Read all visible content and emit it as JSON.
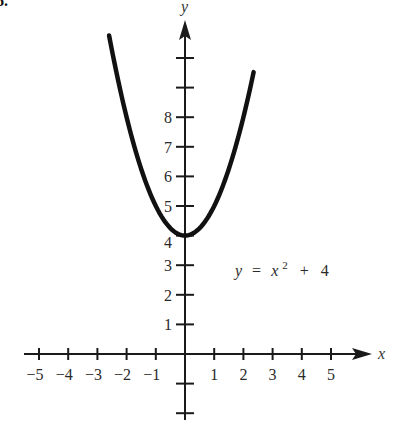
{
  "problem_number": "6.",
  "chart_data": {
    "type": "line",
    "title": "",
    "equation_label": "y = x² + 4",
    "equation_parts": {
      "lhs": "y",
      "eq": "=",
      "var": "x",
      "exp": "2",
      "plus": "+",
      "const": "4"
    },
    "xlabel": "x",
    "ylabel": "y",
    "x_ticks": [
      -5,
      -4,
      -3,
      -2,
      -1,
      1,
      2,
      3,
      4,
      5
    ],
    "x_tick_labels": [
      "−5",
      "−4",
      "−3",
      "−2",
      "−1",
      "1",
      "2",
      "3",
      "4",
      "5"
    ],
    "y_ticks": [
      1,
      2,
      3,
      4,
      5,
      6,
      7,
      8,
      9,
      10,
      -1,
      -2
    ],
    "y_tick_labels": [
      "1",
      "2",
      "3",
      "4",
      "5",
      "6",
      "7",
      "8"
    ],
    "xlim": [
      -5.5,
      6.5
    ],
    "ylim": [
      -2.7,
      11.2
    ],
    "grid": false,
    "legend": "none",
    "series": [
      {
        "name": "y = x^2 + 4",
        "function": "x^2 + 4",
        "x_range": [
          -2.6,
          2.35
        ],
        "points": [
          {
            "x": -2.6,
            "y": 10.76
          },
          {
            "x": -2,
            "y": 8
          },
          {
            "x": -1,
            "y": 5
          },
          {
            "x": 0,
            "y": 4
          },
          {
            "x": 1,
            "y": 5
          },
          {
            "x": 2,
            "y": 8
          },
          {
            "x": 2.35,
            "y": 9.52
          }
        ]
      }
    ],
    "annotations": [
      {
        "text": "y = x² + 4",
        "x": 2.5,
        "y": 3
      }
    ],
    "colors": {
      "curve": "#111111",
      "axes": "#1a1a1a"
    }
  }
}
